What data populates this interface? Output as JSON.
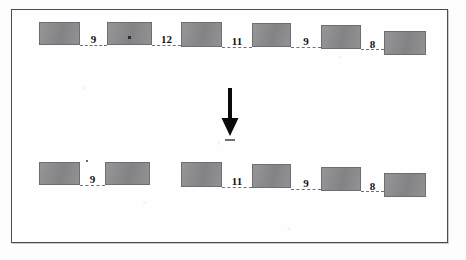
{
  "figure": {
    "type": "diagram",
    "frame_color": "#4a4a52",
    "box_fill_color": "#8a8a8c",
    "box_border_color": "#6d6d72",
    "label_color": "#111114",
    "connector_color": "#6f6f76",
    "arrow_color": "#000000"
  },
  "top_row": {
    "name": "before-sequence",
    "boxes": [
      {
        "id": "t1",
        "x": 27,
        "y": 12,
        "w": 41,
        "h": 23,
        "dot": false
      },
      {
        "id": "t2",
        "x": 95,
        "y": 12,
        "w": 45,
        "h": 23,
        "dot": true
      },
      {
        "id": "t3",
        "x": 169,
        "y": 12,
        "w": 41,
        "h": 25,
        "dot": false
      },
      {
        "id": "t4",
        "x": 240,
        "y": 13,
        "w": 39,
        "h": 24,
        "dot": false
      },
      {
        "id": "t5",
        "x": 309,
        "y": 15,
        "w": 40,
        "h": 24,
        "dot": false
      },
      {
        "id": "t6",
        "x": 372,
        "y": 21,
        "w": 42,
        "h": 24,
        "dot": false
      }
    ],
    "gaps": [
      {
        "id": "g1",
        "label": "9",
        "x": 68,
        "y": 25,
        "w": 27
      },
      {
        "id": "g2",
        "label": "12",
        "x": 140,
        "y": 25,
        "w": 29
      },
      {
        "id": "g3",
        "label": "11",
        "x": 210,
        "y": 26,
        "w": 30
      },
      {
        "id": "g4",
        "label": "9",
        "x": 279,
        "y": 27,
        "w": 30
      },
      {
        "id": "g5",
        "label": "8",
        "x": 349,
        "y": 31,
        "w": 23
      }
    ]
  },
  "arrow": {
    "name": "downward-transform-arrow",
    "x": 218,
    "y": 78,
    "length": 48,
    "shaft_width": 4,
    "head_width": 17,
    "head_height": 16
  },
  "bottom_row": {
    "name": "after-sequence",
    "boxes": [
      {
        "id": "b1",
        "x": 27,
        "y": 152,
        "w": 41,
        "h": 23,
        "dot": false
      },
      {
        "id": "b2",
        "x": 93,
        "y": 152,
        "w": 45,
        "h": 23,
        "dot": false
      },
      {
        "id": "b3",
        "x": 169,
        "y": 152,
        "w": 41,
        "h": 25,
        "dot": false
      },
      {
        "id": "b4",
        "x": 240,
        "y": 154,
        "w": 39,
        "h": 24,
        "dot": false
      },
      {
        "id": "b5",
        "x": 309,
        "y": 157,
        "w": 40,
        "h": 24,
        "dot": false
      },
      {
        "id": "b6",
        "x": 372,
        "y": 163,
        "w": 42,
        "h": 24,
        "dot": false
      }
    ],
    "gaps": [
      {
        "id": "h1",
        "label": "9",
        "x": 68,
        "y": 165,
        "w": 25
      },
      {
        "id": "h2",
        "label": "11",
        "x": 210,
        "y": 167,
        "w": 30
      },
      {
        "id": "h3",
        "label": "9",
        "x": 279,
        "y": 169,
        "w": 30
      },
      {
        "id": "h4",
        "label": "8",
        "x": 349,
        "y": 173,
        "w": 23
      }
    ],
    "speck": {
      "x": 74,
      "y": 150,
      "d": 2
    }
  }
}
